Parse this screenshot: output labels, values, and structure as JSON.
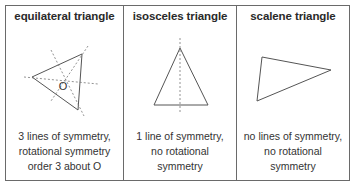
{
  "table": {
    "columns": [
      {
        "header": "equilateral triangle",
        "caption_lines": [
          "3 lines of symmetry,",
          "rotational symmetry",
          "order 3 about O"
        ],
        "figure": {
          "icon": "equilateral-triangle-with-symmetry-lines",
          "center_label": "O"
        }
      },
      {
        "header": "isosceles triangle",
        "caption_lines": [
          "1 line of symmetry,",
          "no rotational",
          "symmetry"
        ],
        "figure": {
          "icon": "isosceles-triangle-with-symmetry-line"
        }
      },
      {
        "header": "scalene triangle",
        "caption_lines": [
          "no lines of symmetry,",
          "no rotational",
          "symmetry"
        ],
        "figure": {
          "icon": "scalene-triangle"
        }
      }
    ]
  },
  "colors": {
    "line": "#555555",
    "border": "#6a6a6a",
    "text": "#2a2a2a"
  }
}
